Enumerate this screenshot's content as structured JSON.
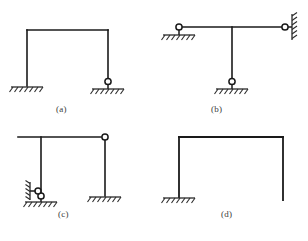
{
  "figure": {
    "background_color": "#ffffff",
    "line_color": "#1a1a1a",
    "hatch_color": "#2b2b2b",
    "label_color": "#3a3a3a",
    "caption": "",
    "panels": [
      {
        "id": "a",
        "label": "(a)",
        "description": "Portal frame with fixed base at left column and pinned base at right column",
        "members": [
          {
            "name": "left-column",
            "type": "vertical"
          },
          {
            "name": "top-beam",
            "type": "horizontal"
          },
          {
            "name": "right-column",
            "type": "vertical"
          }
        ],
        "supports": [
          {
            "name": "fixed-support-left",
            "kind": "fixed-ground",
            "hinge": false
          },
          {
            "name": "pinned-support-right",
            "kind": "pin-ground",
            "hinge": true
          }
        ]
      },
      {
        "id": "b",
        "label": "(b)",
        "description": "T-shaped frame: horizontal beam pinned at left ground support and pinned to vertical wall at right, with central hanging column pinned to ground",
        "members": [
          {
            "name": "horizontal-beam",
            "type": "horizontal"
          },
          {
            "name": "center-column",
            "type": "vertical"
          }
        ],
        "supports": [
          {
            "name": "pinned-support-left",
            "kind": "pin-ground",
            "hinge": true
          },
          {
            "name": "pinned-support-right-wall",
            "kind": "pin-wall",
            "hinge": true
          },
          {
            "name": "pinned-support-bottom",
            "kind": "pin-ground",
            "hinge": true
          }
        ]
      },
      {
        "id": "c",
        "label": "(c)",
        "description": "Frame with overhanging beam, internal hinge at top right corner, left column on pin-to-ground plus horizontal link to wall, right column fixed to ground",
        "members": [
          {
            "name": "top-beam-with-overhang",
            "type": "horizontal"
          },
          {
            "name": "left-column",
            "type": "vertical"
          },
          {
            "name": "right-column",
            "type": "vertical"
          }
        ],
        "supports": [
          {
            "name": "pinned-support-left-ground",
            "kind": "pin-ground",
            "hinge": true
          },
          {
            "name": "link-support-left-wall",
            "kind": "pin-wall-link",
            "hinge": true
          },
          {
            "name": "fixed-support-right",
            "kind": "fixed-ground",
            "hinge": false
          }
        ],
        "hinges": [
          {
            "name": "internal-hinge-top-right",
            "position": "top-right-corner"
          }
        ]
      },
      {
        "id": "d",
        "label": "(d)",
        "description": "Portal frame fixed at left base with free-ended right column (cantilever)",
        "members": [
          {
            "name": "left-column",
            "type": "vertical"
          },
          {
            "name": "top-beam",
            "type": "horizontal"
          },
          {
            "name": "right-column",
            "type": "vertical"
          }
        ],
        "supports": [
          {
            "name": "fixed-support-left",
            "kind": "fixed-ground",
            "hinge": false
          },
          {
            "name": "free-end-right",
            "kind": "free",
            "hinge": false
          }
        ]
      }
    ]
  }
}
